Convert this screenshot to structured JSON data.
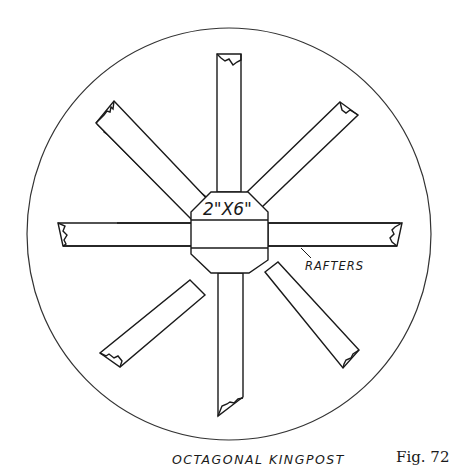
{
  "diagram": {
    "title": "OCTAGONAL KINGPOST",
    "figure_number": "Fig. 72",
    "center_label": "2\"X6\"",
    "callout_label": "RAFTERS",
    "elements": [
      {
        "type": "circle",
        "description": "outer boundary circle"
      },
      {
        "type": "octagon",
        "description": "kingpost cross-section with 2x6 band"
      },
      {
        "type": "rafter",
        "direction": "north"
      },
      {
        "type": "rafter",
        "direction": "northeast"
      },
      {
        "type": "rafter",
        "direction": "east"
      },
      {
        "type": "rafter",
        "direction": "southeast"
      },
      {
        "type": "rafter",
        "direction": "south"
      },
      {
        "type": "rafter",
        "direction": "southwest"
      },
      {
        "type": "rafter",
        "direction": "west"
      },
      {
        "type": "rafter",
        "direction": "northwest"
      }
    ],
    "colors": {
      "ink": "#1a1a1a",
      "background": "#ffffff"
    }
  }
}
